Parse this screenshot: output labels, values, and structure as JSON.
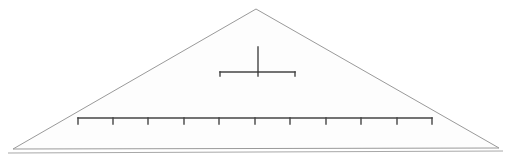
{
  "diagram": {
    "name": "hierarchical-pyramid-tree",
    "title": "",
    "canvas": {
      "width": 510,
      "height": 160
    },
    "colors": {
      "background": "#ffffff",
      "triangle_fill": "#fbfbfb",
      "triangle_stroke": "#9a9a9a",
      "node_fill": "#f1f1f1",
      "node_stroke": "#949494",
      "connector": "#444444",
      "base_line": "#a8a8a8"
    },
    "triangle": {
      "apex": {
        "x": 256,
        "y": 9
      },
      "bottom_left": {
        "x": 13,
        "y": 149
      },
      "bottom_right": {
        "x": 499,
        "y": 148
      },
      "base_line": {
        "x1": 8,
        "y1": 153,
        "x2": 503,
        "y2": 151
      }
    },
    "node_radius": 12,
    "levels": [
      {
        "name": "root-level",
        "index": 0,
        "label": "",
        "y": 35,
        "count": 1,
        "nodes": [
          {
            "id": "n0",
            "label": "",
            "cx": 258,
            "cy": 35
          }
        ]
      },
      {
        "name": "middle-level",
        "index": 1,
        "label": "",
        "y": 88,
        "count": 3,
        "bus_y": 72,
        "bus_x1": 220,
        "bus_x2": 295,
        "nodes": [
          {
            "id": "n1",
            "label": "",
            "cx": 220,
            "cy": 88
          },
          {
            "id": "n2",
            "label": "",
            "cx": 258,
            "cy": 88
          },
          {
            "id": "n3",
            "label": "",
            "cx": 295,
            "cy": 88
          }
        ]
      },
      {
        "name": "leaf-level",
        "index": 2,
        "label": "",
        "y": 136,
        "count": 11,
        "bus_y": 118,
        "bus_x1": 78,
        "bus_x2": 432,
        "nodes": [
          {
            "id": "l1",
            "label": "",
            "cx": 78,
            "cy": 136
          },
          {
            "id": "l2",
            "label": "",
            "cx": 113,
            "cy": 136
          },
          {
            "id": "l3",
            "label": "",
            "cx": 148,
            "cy": 136
          },
          {
            "id": "l4",
            "label": "",
            "cx": 184,
            "cy": 136
          },
          {
            "id": "l5",
            "label": "",
            "cx": 219,
            "cy": 136
          },
          {
            "id": "l6",
            "label": "",
            "cx": 255,
            "cy": 136
          },
          {
            "id": "l7",
            "label": "",
            "cx": 290,
            "cy": 136
          },
          {
            "id": "l8",
            "label": "",
            "cx": 326,
            "cy": 136
          },
          {
            "id": "l9",
            "label": "",
            "cx": 361,
            "cy": 136
          },
          {
            "id": "l10",
            "label": "",
            "cx": 397,
            "cy": 136
          },
          {
            "id": "l11",
            "label": "",
            "cx": 432,
            "cy": 136
          }
        ]
      }
    ],
    "connectors": {
      "root_stem": {
        "x": 258,
        "y1": 47,
        "y2": 72
      },
      "middle_stems_y1": 72,
      "middle_stems_y2": 76,
      "leaf_stems_y1": 118,
      "leaf_stems_y2": 124
    }
  }
}
